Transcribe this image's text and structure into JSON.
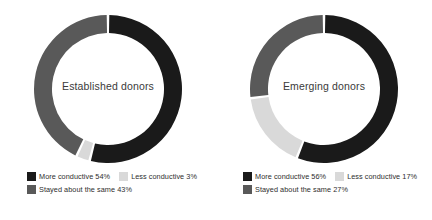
{
  "theme": {
    "background": "#ffffff",
    "text_color": "#2e2e2e",
    "center_label_color": "#3a3a3a",
    "color_more_conductive": "#1a1a1a",
    "color_less_conductive": "#d9d9d9",
    "color_stayed_same": "#595959"
  },
  "charts": [
    {
      "id": "established-donors",
      "center_label": "Established donors",
      "legend": [
        {
          "label": "More conductive 54%",
          "color": "#1a1a1a"
        },
        {
          "label": "Less conductive 3%",
          "color": "#d9d9d9"
        },
        {
          "label": "Stayed about the same 43%",
          "color": "#595959"
        }
      ]
    },
    {
      "id": "emerging-donors",
      "center_label": "Emerging donors",
      "legend": [
        {
          "label": "More conductive 56%",
          "color": "#1a1a1a"
        },
        {
          "label": "Less conductive 17%",
          "color": "#d9d9d9"
        },
        {
          "label": "Stayed about the same 27%",
          "color": "#595959"
        }
      ]
    }
  ],
  "chart_data": [
    {
      "type": "pie",
      "title": "Established donors",
      "variant": "donut",
      "hole_ratio": 0.757,
      "start_angle_deg": 0,
      "direction": "clockwise",
      "gap_deg": 2,
      "labels": [
        "More conductive",
        "Less conductive",
        "Stayed about the same"
      ],
      "values": [
        54,
        3,
        43
      ],
      "unit": "%",
      "colors": [
        "#1a1a1a",
        "#d9d9d9",
        "#595959"
      ],
      "legend_position": "bottom",
      "grid": false
    },
    {
      "type": "pie",
      "title": "Emerging donors",
      "variant": "donut",
      "hole_ratio": 0.757,
      "start_angle_deg": 0,
      "direction": "clockwise",
      "gap_deg": 2,
      "labels": [
        "More conductive",
        "Less conductive",
        "Stayed about the same"
      ],
      "values": [
        56,
        17,
        27
      ],
      "unit": "%",
      "colors": [
        "#1a1a1a",
        "#d9d9d9",
        "#595959"
      ],
      "legend_position": "bottom",
      "grid": false
    }
  ]
}
